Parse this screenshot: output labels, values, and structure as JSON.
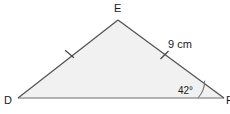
{
  "figure": {
    "type": "triangle-geometry-diagram",
    "background_color": "#ffffff",
    "fill_color": "#f1f1f1",
    "stroke_color": "#555555",
    "base_stroke_color": "#9a9a9a",
    "vertices": [
      {
        "name": "D",
        "label": "D",
        "x": 18,
        "y": 98,
        "label_x": 4,
        "label_y": 104
      },
      {
        "name": "E",
        "label": "E",
        "x": 118,
        "y": 20,
        "label_x": 114,
        "label_y": 12
      },
      {
        "name": "F",
        "label": "F",
        "x": 224,
        "y": 98,
        "label_x": 226,
        "label_y": 104
      }
    ],
    "sides": [
      {
        "name": "side-DE",
        "from": "D",
        "to": "E",
        "tick_count": 1,
        "tick_x": 70,
        "tick_y": 54
      },
      {
        "name": "side-EF",
        "from": "E",
        "to": "F",
        "tick_count": 1,
        "tick_x": 164,
        "tick_y": 55,
        "length_label": "9 cm",
        "label_x": 168,
        "label_y": 48
      },
      {
        "name": "side-DF",
        "from": "D",
        "to": "F",
        "tick_count": 0
      }
    ],
    "angles": [
      {
        "name": "angle-F",
        "at": "F",
        "label": "42°",
        "value": 42,
        "unit": "degrees",
        "label_x": 178,
        "label_y": 94,
        "arc_radius": 26
      }
    ],
    "congruence_note": "DE and EF marked with single ticks (equal length)"
  }
}
